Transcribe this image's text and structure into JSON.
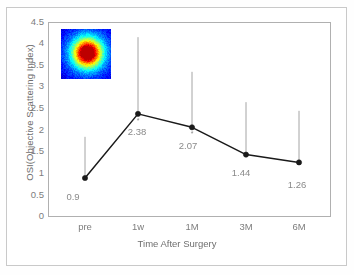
{
  "chart_data": {
    "type": "line",
    "title": "",
    "xlabel": "Time After Surgery",
    "ylabel": "OSI(Objective Scattering Index)",
    "categories": [
      "pre",
      "1w",
      "1M",
      "3M",
      "6M"
    ],
    "values": [
      0.9,
      2.38,
      2.07,
      1.44,
      1.26
    ],
    "value_labels": [
      "0.9",
      "2.38",
      "2.07",
      "1.44",
      "1.26"
    ],
    "error_upper": [
      1.85,
      4.15,
      3.35,
      2.65,
      2.45
    ],
    "ylim": [
      0,
      4.5
    ],
    "yticks": [
      "0",
      "0.5",
      "1",
      "1.5",
      "2",
      "2.5",
      "3",
      "3.5",
      "4",
      "4.5"
    ],
    "ytick_values": [
      0,
      0.5,
      1,
      1.5,
      2,
      2.5,
      3,
      3.5,
      4,
      4.5
    ],
    "grid": false,
    "legend": "none",
    "marker": "filled-circle",
    "line_color": "#1a1a1a",
    "errorbar_color": "#9a9a9a",
    "axis_color": "#b0b0b0",
    "text_color": "#7d7d7d"
  },
  "inset": {
    "name": "point-spread-function-heatmap",
    "colormap": "jet",
    "description": "double-pass retinal image"
  }
}
